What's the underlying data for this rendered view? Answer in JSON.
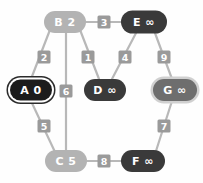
{
  "canvas": {
    "width": 203,
    "height": 183,
    "background": "#fefefe"
  },
  "palette": {
    "background": "#fefefe",
    "node_light_gray": "#b3b3b3",
    "node_dark": "#3a3a3a",
    "node_black": "#1c1c1c",
    "node_mid_gray": "#6e6e6e",
    "node_text_on_light": "#ffffff",
    "node_text_on_dark": "#ffffff",
    "edge_stroke": "#b8b8b8",
    "edge_label_fill": "#9a9a9a",
    "edge_label_text": "#ffffff",
    "ring_outer": "#2b2b2b",
    "ring_inner": "#ffffff",
    "ring_g_outer": "#d0d0d0"
  },
  "graph": {
    "type": "weighted-undirected-graph",
    "nodes": [
      {
        "id": "A",
        "name": "A",
        "distance": "0",
        "label": "A 0",
        "cx": 31,
        "cy": 90,
        "rx": 21,
        "ry": 10.5,
        "fill": "#1c1c1c",
        "text": "#ffffff",
        "style": "double-ring-current",
        "ring_outer": "#2b2b2b",
        "ring_inner": "#ffffff"
      },
      {
        "id": "B",
        "name": "B",
        "distance": "2",
        "label": "B 2",
        "cx": 65,
        "cy": 22,
        "rx": 21,
        "ry": 11,
        "fill": "#b3b3b3",
        "text": "#ffffff",
        "style": "plain"
      },
      {
        "id": "C",
        "name": "C",
        "distance": "5",
        "label": "C 5",
        "cx": 66,
        "cy": 161,
        "rx": 21,
        "ry": 11,
        "fill": "#b3b3b3",
        "text": "#ffffff",
        "style": "plain"
      },
      {
        "id": "D",
        "name": "D",
        "distance": "∞",
        "label": "D ∞",
        "cx": 105,
        "cy": 90,
        "rx": 21,
        "ry": 11,
        "fill": "#3a3a3a",
        "text": "#ffffff",
        "style": "plain"
      },
      {
        "id": "E",
        "name": "E",
        "distance": "∞",
        "label": "E ∞",
        "cx": 144,
        "cy": 22,
        "rx": 23,
        "ry": 11.5,
        "fill": "#3a3a3a",
        "text": "#ffffff",
        "style": "plain"
      },
      {
        "id": "F",
        "name": "F",
        "distance": "∞",
        "label": "F ∞",
        "cx": 143,
        "cy": 161,
        "rx": 22,
        "ry": 11,
        "fill": "#3a3a3a",
        "text": "#ffffff",
        "style": "plain"
      },
      {
        "id": "G",
        "name": "G",
        "distance": "∞",
        "label": "G ∞",
        "cx": 175,
        "cy": 90,
        "rx": 22,
        "ry": 11,
        "fill": "#6e6e6e",
        "text": "#ffffff",
        "style": "ring",
        "ring_outer": "#d0d0d0"
      }
    ],
    "edges": [
      {
        "id": "B-E",
        "from": "B",
        "to": "E",
        "weight": "3",
        "x1": 86,
        "y1": 22,
        "x2": 121,
        "y2": 22,
        "lx": 104,
        "ly": 22
      },
      {
        "id": "A-B",
        "from": "A",
        "to": "B",
        "weight": "2",
        "x1": 53,
        "y1": 22,
        "x2": 31,
        "y2": 79,
        "lx": 44,
        "ly": 57
      },
      {
        "id": "B-D",
        "from": "B",
        "to": "D",
        "weight": "1",
        "x1": 77,
        "y1": 22,
        "x2": 99,
        "y2": 79,
        "lx": 88,
        "ly": 57
      },
      {
        "id": "B-C",
        "from": "B",
        "to": "C",
        "weight": "6",
        "x1": 66,
        "y1": 22,
        "x2": 66,
        "y2": 150,
        "lx": 66,
        "ly": 91
      },
      {
        "id": "D-E",
        "from": "D",
        "to": "E",
        "weight": "4",
        "x1": 112,
        "y1": 79,
        "x2": 136,
        "y2": 33,
        "lx": 125,
        "ly": 57
      },
      {
        "id": "E-G",
        "from": "E",
        "to": "G",
        "weight": "9",
        "x1": 155,
        "y1": 33,
        "x2": 172,
        "y2": 79,
        "lx": 164,
        "ly": 57
      },
      {
        "id": "A-C",
        "from": "A",
        "to": "C",
        "weight": "5",
        "x1": 31,
        "y1": 101,
        "x2": 55,
        "y2": 152,
        "lx": 44,
        "ly": 126
      },
      {
        "id": "F-G",
        "from": "F",
        "to": "G",
        "weight": "7",
        "x1": 156,
        "y1": 151,
        "x2": 172,
        "y2": 101,
        "lx": 164,
        "ly": 126
      },
      {
        "id": "C-F",
        "from": "C",
        "to": "F",
        "weight": "8",
        "x1": 87,
        "y1": 161,
        "x2": 121,
        "y2": 161,
        "lx": 104,
        "ly": 161
      }
    ],
    "edge_label_box": {
      "w": 13,
      "h": 13,
      "r": 1.5
    }
  }
}
